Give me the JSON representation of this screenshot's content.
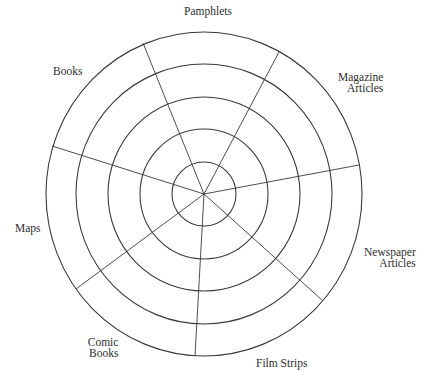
{
  "diagram": {
    "type": "concentric-ring-target",
    "center": {
      "x": 204,
      "y": 194
    },
    "rings": [
      {
        "rx": 32,
        "ry": 32
      },
      {
        "rx": 64,
        "ry": 65
      },
      {
        "rx": 96,
        "ry": 97
      },
      {
        "rx": 128,
        "ry": 130
      },
      {
        "rx": 158,
        "ry": 162
      }
    ],
    "spokes": [
      {
        "x": 143,
        "y": 43
      },
      {
        "x": 279,
        "y": 52
      },
      {
        "x": 359,
        "y": 165
      },
      {
        "x": 322,
        "y": 300
      },
      {
        "x": 195,
        "y": 356
      },
      {
        "x": 76,
        "y": 289
      },
      {
        "x": 52,
        "y": 146
      }
    ],
    "colors": {
      "line": "#3a3a3a",
      "text": "#2e2e2e",
      "background": "#ffffff"
    }
  },
  "segments": [
    {
      "id": "pamphlets",
      "lines": [
        "Pamphlets"
      ]
    },
    {
      "id": "magazine-articles",
      "lines": [
        "Magazine",
        "Articles"
      ]
    },
    {
      "id": "newspaper-articles",
      "lines": [
        "Newspaper",
        "Articles"
      ]
    },
    {
      "id": "film-strips",
      "lines": [
        "Film Strips"
      ]
    },
    {
      "id": "comic-books",
      "lines": [
        "Comic",
        "Books"
      ]
    },
    {
      "id": "maps",
      "lines": [
        "Maps"
      ]
    },
    {
      "id": "books",
      "lines": [
        "Books"
      ]
    }
  ]
}
